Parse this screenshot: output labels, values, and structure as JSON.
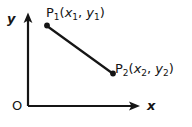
{
  "figure": {
    "background_color": "#ffffff",
    "stroke_color": "#151515"
  },
  "axes": {
    "y_axis": {
      "label": "y",
      "icon": "arrow-up-icon",
      "x": 28,
      "y_top": 16,
      "y_bottom": 106
    },
    "x_axis": {
      "label": "x",
      "icon": "arrow-right-icon",
      "y": 106,
      "x_left": 28,
      "x_right": 136
    },
    "origin": {
      "label": "O",
      "x": 28,
      "y": 106
    }
  },
  "points": [
    {
      "name": "P1",
      "label_prefix": "P",
      "label_index": "1",
      "coord_x_var": "x",
      "coord_x_index": "1",
      "coord_y_var": "y",
      "coord_y_index": "1",
      "marker_x": 47,
      "marker_y": 26
    },
    {
      "name": "P2",
      "label_prefix": "P",
      "label_index": "2",
      "coord_x_var": "x",
      "coord_x_index": "2",
      "coord_y_var": "y",
      "coord_y_index": "2",
      "marker_x": 113,
      "marker_y": 74
    }
  ],
  "segment": {
    "from": "P1",
    "to": "P2",
    "x1": 47,
    "y1": 26,
    "x2": 113,
    "y2": 74
  }
}
